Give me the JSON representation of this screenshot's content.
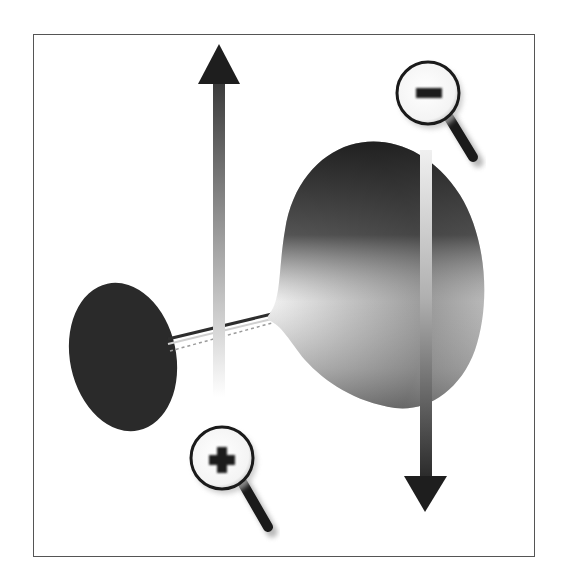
{
  "figure": {
    "description": "Zoom diagram: a cone/funnel shape connected by a thin line to a dark ellipse, with an upward arrow beside a zoom-in magnifier and a downward arrow beside a zoom-out magnifier",
    "frame_color": "#555555",
    "background": "#ffffff"
  },
  "elements": {
    "up_arrow": {
      "label": "zoom in direction",
      "color_top": "#1e1e1e",
      "color_bottom": "#ffffff"
    },
    "down_arrow": {
      "label": "zoom out direction",
      "color_top": "#e6e6e6",
      "color_bottom": "#1e1e1e"
    },
    "zoom_in_icon": {
      "symbol": "+",
      "label": "zoom in"
    },
    "zoom_out_icon": {
      "symbol": "−",
      "label": "zoom out"
    },
    "ellipse": {
      "label": "far object",
      "color": "#2a2a2a"
    },
    "cone": {
      "label": "near object",
      "color_dark": "#1f1f1f",
      "color_light": "#dcdcdc"
    }
  }
}
